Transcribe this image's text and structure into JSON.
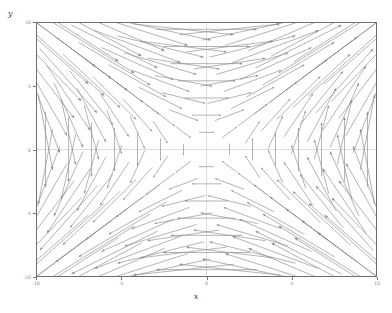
{
  "figure": {
    "background": "#ffffff",
    "frame_color": "#6e6e6e",
    "arrow_color": "#8a8a8a",
    "zero_line_color": "#d8d8d8"
  },
  "axes": {
    "x_label": "x",
    "y_label": "y",
    "x_ticks": [
      "-10",
      "-5",
      "0",
      "5",
      "10"
    ],
    "y_ticks": [
      "10",
      "5",
      "0",
      "-5",
      "-10"
    ],
    "x_tick_values": [
      -10,
      -5,
      0,
      5,
      10
    ],
    "y_tick_values": [
      10,
      5,
      0,
      -5,
      -10
    ]
  },
  "chart_data": {
    "type": "scatter",
    "plot_kind": "vector-field",
    "title": "",
    "subtitle": "",
    "xlabel": "x",
    "ylabel": "y",
    "xlim": [
      -10,
      10
    ],
    "ylim": [
      -10,
      10
    ],
    "grid": false,
    "legend": "none",
    "annotations": [],
    "xtick_labels": [
      "-10",
      "-5",
      "0",
      "5",
      "10"
    ],
    "ytick_labels": [
      "-10",
      "-5",
      "0",
      "5",
      "10"
    ],
    "field": {
      "u_expression": "y",
      "v_expression": "x",
      "description": "Saddle-type vector field F(x,y) = (y, x); arrows horizontal on the y-axis and vertical on the x-axis, diverging along the line y=x and converging along y=-x.",
      "grid_nx": 15,
      "grid_ny": 15,
      "x_start": -9.5,
      "x_end": 9.5,
      "y_start": -9.5,
      "y_end": 9.5,
      "arrow_scale": 0.62,
      "max_arrow_length_units": 2.6,
      "arrowhead": "dot-tip",
      "sample_vectors": [
        {
          "x": -9.5,
          "y": 9.5,
          "u": 9.5,
          "v": -9.5
        },
        {
          "x": 0.0,
          "y": 9.5,
          "u": 9.5,
          "v": 0.0
        },
        {
          "x": 9.5,
          "y": 9.5,
          "u": 9.5,
          "v": 9.5
        },
        {
          "x": -9.5,
          "y": 0.0,
          "u": 0.0,
          "v": -9.5
        },
        {
          "x": 0.0,
          "y": 0.0,
          "u": 0.0,
          "v": 0.0
        },
        {
          "x": 9.5,
          "y": 0.0,
          "u": 0.0,
          "v": 9.5
        },
        {
          "x": -9.5,
          "y": -9.5,
          "u": -9.5,
          "v": -9.5
        },
        {
          "x": 0.0,
          "y": -9.5,
          "u": -9.5,
          "v": 0.0
        },
        {
          "x": 9.5,
          "y": -9.5,
          "u": -9.5,
          "v": 9.5
        }
      ]
    }
  }
}
